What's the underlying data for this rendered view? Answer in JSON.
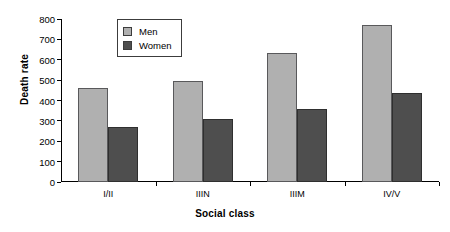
{
  "chart_data": {
    "type": "bar",
    "title": "",
    "xlabel": "Social class",
    "ylabel": "Death rate",
    "categories": [
      "I/II",
      "IIIN",
      "IIIM",
      "IV/V"
    ],
    "series": [
      {
        "name": "Men",
        "values": [
          460,
          495,
          635,
          770
        ],
        "color": "#b0b0b0"
      },
      {
        "name": "Women",
        "values": [
          270,
          310,
          360,
          435
        ],
        "color": "#4e4e4e"
      }
    ],
    "ylim": [
      0,
      800
    ],
    "ytick_labels": [
      "0",
      "100",
      "200",
      "300",
      "400",
      "500",
      "600",
      "700",
      "800"
    ],
    "ytick_values": [
      0,
      100,
      200,
      300,
      400,
      500,
      600,
      700,
      800
    ],
    "grid": false,
    "legend_position": "top-center",
    "legend_entries": [
      "Men",
      "Women"
    ]
  }
}
